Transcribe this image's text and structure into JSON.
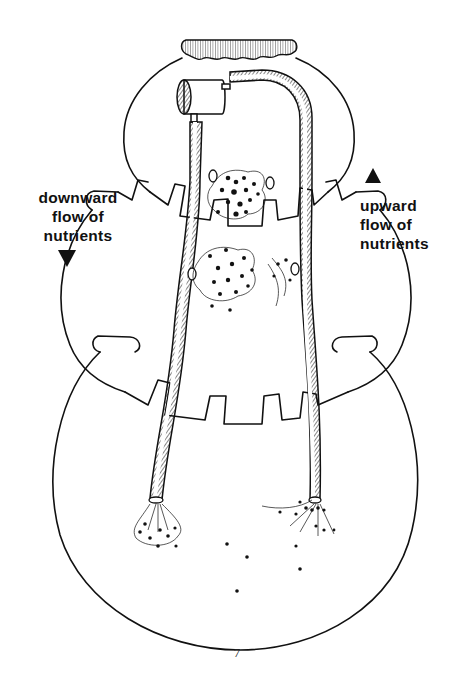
{
  "figure": {
    "labels": {
      "left": {
        "lines": [
          "downward",
          "flow of",
          "nutrients"
        ],
        "arrow": "down"
      },
      "right": {
        "lines": [
          "upward",
          "flow of",
          "nutrients"
        ],
        "arrow": "up"
      }
    },
    "parts": [
      "cloth-cover",
      "top-pot",
      "middle-pot",
      "bottom-pot",
      "pump",
      "downward-tube",
      "upward-tube",
      "nutrient-clusters",
      "roots"
    ],
    "colors": {
      "ink": "#111111",
      "paper": "#ffffff"
    }
  },
  "page": {
    "number": "7"
  }
}
